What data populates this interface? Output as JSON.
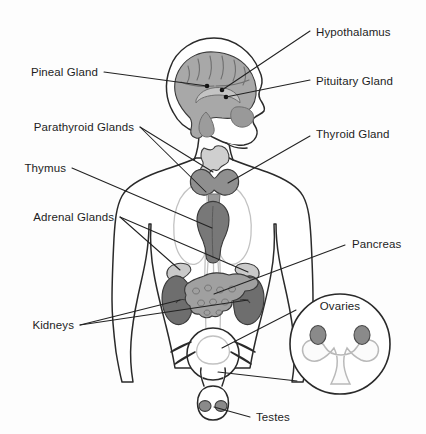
{
  "diagram": {
    "background_color": "#fdfdfd",
    "line_color": "#222222",
    "text_color": "#1d1d1d"
  },
  "labels": {
    "hypothalamus": "Hypothalamus",
    "pituitary_gland": "Pituitary Gland",
    "thyroid_gland": "Thyroid Gland",
    "pancreas": "Pancreas",
    "ovaries": "Ovaries",
    "testes": "Testes",
    "pineal_gland": "Pineal Gland",
    "parathyroid_glands": "Parathyroid Glands",
    "thymus": "Thymus",
    "adrenal_glands": "Adrenal Glands",
    "kidneys": "Kidneys"
  },
  "organ_colors": {
    "brain": "#a8a8a8",
    "brain_detail": "#8e8e8e",
    "larynx": "#cfcfcf",
    "thyroid": "#8f8f8f",
    "thymus": "#787878",
    "kidney": "#6e6e6e",
    "adrenal": "#c9c9c9",
    "pancreas": "#a0a0a0",
    "ovary": "#8a8a8a",
    "testis": "#8a8a8a",
    "lung": "#f4f4f4",
    "skin": "#ffffff"
  }
}
